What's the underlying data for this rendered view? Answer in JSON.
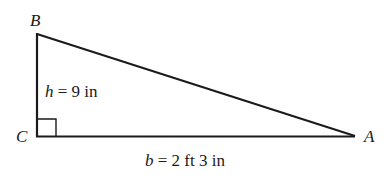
{
  "figure": {
    "type": "right-triangle",
    "stroke_color": "#1a1a1a",
    "background": "#ffffff",
    "vertices": {
      "B": {
        "label": "B",
        "x": 37,
        "y": 34
      },
      "C": {
        "label": "C",
        "x": 37,
        "y": 136
      },
      "A": {
        "label": "A",
        "x": 355,
        "y": 136
      }
    },
    "right_angle_at": "C",
    "height": {
      "variable": "h",
      "equals": " = 9 in"
    },
    "base": {
      "variable": "b",
      "equals": " = 2 ft 3 in"
    }
  }
}
